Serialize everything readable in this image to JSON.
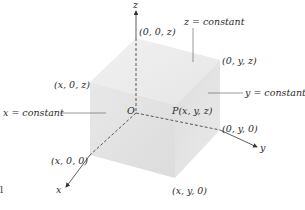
{
  "diagram": {
    "title": "",
    "axes": {
      "x": {
        "label": "x"
      },
      "y": {
        "label": "y"
      },
      "z": {
        "label": "z"
      }
    },
    "origin": {
      "label": "O"
    },
    "point": {
      "label": "P(x, y, z)"
    },
    "vertices": {
      "top_z": "(0, 0, z)",
      "xz": "(x, 0, z)",
      "yz": "(0, y, z)",
      "x0": "(x, 0, 0)",
      "y0": "(0, y, 0)",
      "xy0": "(x, y, 0)"
    },
    "planes": {
      "z_const": "z = constant",
      "y_const": "y = constant",
      "x_const": "x = constant"
    },
    "colors": {
      "face_top": "#ececec",
      "face_left": "#e3e3e3",
      "face_right": "#d9d9d9",
      "line": "#333333"
    }
  },
  "page_marker": "l"
}
